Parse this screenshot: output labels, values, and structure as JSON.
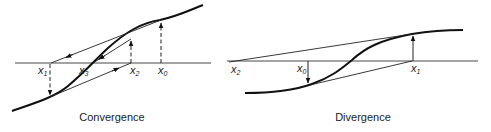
{
  "panels": [
    {
      "caption": "Convergence",
      "labels": {
        "x0": {
          "base": "x",
          "sub": "0"
        },
        "x1": {
          "base": "x",
          "sub": "1"
        },
        "x2": {
          "base": "x",
          "sub": "2"
        },
        "x3": {
          "base": "x",
          "sub": "3"
        }
      }
    },
    {
      "caption": "Divergence",
      "labels": {
        "x0": {
          "base": "x",
          "sub": "0"
        },
        "x1": {
          "base": "x",
          "sub": "1"
        },
        "x2": {
          "base": "x",
          "sub": "2"
        }
      }
    }
  ]
}
